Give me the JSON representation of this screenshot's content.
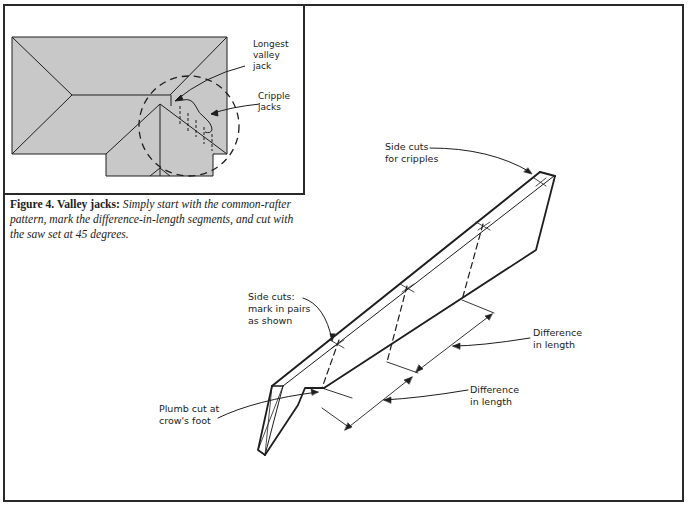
{
  "inset": {
    "labels": {
      "longest_valley_jack": "Longest\nvalley\njack",
      "cripple_jacks": "Cripple\njacks"
    },
    "roof_fill": "#c8c8c8"
  },
  "caption": {
    "lead": "Figure 4. Valley jacks:",
    "body": " Simply start with the common-rafter pattern, mark the difference-in-length segments, and cut with the saw set at 45 degrees."
  },
  "main": {
    "labels": {
      "side_cuts_cripples": "Side cuts\nfor cripples",
      "side_cuts_pairs": "Side cuts:\nmark in pairs\nas shown",
      "difference_upper": "Difference\nin length",
      "difference_lower": "Difference\nin length",
      "plumb_cut": "Plumb cut at\ncrow's foot"
    }
  },
  "colors": {
    "line": "#1e1e1e",
    "roof": "#c8c8c8",
    "frame": "#2a2a2a"
  }
}
